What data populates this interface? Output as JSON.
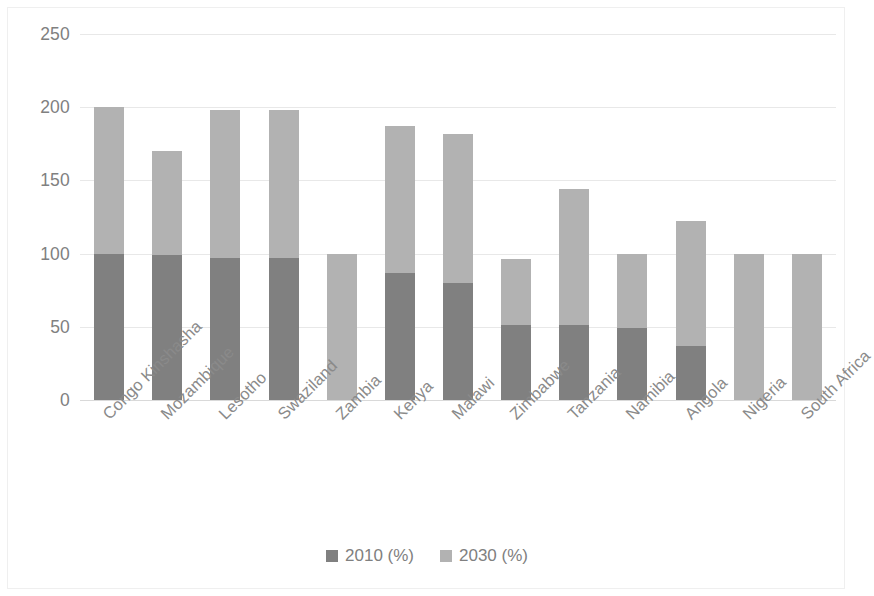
{
  "chart_data": {
    "type": "bar",
    "subtype": "stacked-column",
    "title": "",
    "xlabel": "",
    "ylabel": "",
    "ylim": [
      0,
      250
    ],
    "ytick_labels": [
      "250",
      "200",
      "150",
      "100",
      "50",
      "0"
    ],
    "ytick_values": [
      250,
      200,
      150,
      100,
      50,
      0
    ],
    "grid": true,
    "legend_position": "bottom",
    "categories": [
      "Congo Kinshasha",
      "Mozambique",
      "Lesotho",
      "Swaziland",
      "Zambia",
      "Kenya",
      "Malawi",
      "Zimbabwe",
      "Tanzania",
      "Namibia",
      "Angola",
      "Nigeria",
      "South Africa"
    ],
    "series": [
      {
        "name": "2010 (%)",
        "color": "#808080",
        "values": [
          100,
          99,
          97,
          97,
          0,
          87,
          80,
          51,
          51,
          49,
          37,
          0,
          0
        ]
      },
      {
        "name": "2030 (%)",
        "color": "#b2b2b2",
        "values": [
          100,
          71,
          101,
          101,
          100,
          100,
          102,
          45,
          93,
          51,
          85,
          100,
          100
        ]
      }
    ],
    "totals": [
      200,
      170,
      198,
      198,
      100,
      187,
      182,
      96,
      144,
      100,
      122,
      100,
      100
    ]
  },
  "legend": {
    "items": [
      {
        "label": "2010 (%)",
        "color": "#808080"
      },
      {
        "label": "2030 (%)",
        "color": "#b2b2b2"
      }
    ]
  },
  "colors": {
    "series_2010": "#808080",
    "series_2030": "#b2b2b2",
    "gridline": "#e8e8e8",
    "axis_text": "#808080",
    "category_text": "#8a8a8a",
    "frame_border": "#efefef",
    "background": "#ffffff"
  }
}
